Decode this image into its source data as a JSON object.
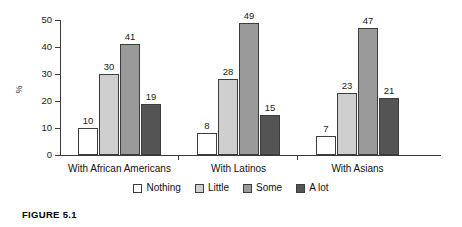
{
  "figure": {
    "caption": "FIGURE 5.1"
  },
  "chart_data": {
    "type": "bar",
    "title": "",
    "subtitle": "",
    "xlabel": "",
    "ylabel": "%",
    "ylim": [
      0,
      50
    ],
    "yticks": [
      0,
      10,
      20,
      30,
      40,
      50
    ],
    "ytick_labels": [
      "0",
      "10",
      "20",
      "30",
      "40",
      "50"
    ],
    "grid": false,
    "legend_position": "bottom",
    "categories": [
      "With African Americans",
      "With Latinos",
      "With Asians"
    ],
    "series": [
      {
        "name": "Nothing",
        "color": "#ffffff",
        "values": [
          10,
          8,
          7
        ]
      },
      {
        "name": "Little",
        "color": "#cfcfcf",
        "values": [
          30,
          28,
          23
        ]
      },
      {
        "name": "Some",
        "color": "#9a9a9a",
        "values": [
          41,
          49,
          47
        ]
      },
      {
        "name": "A lot",
        "color": "#545454",
        "values": [
          19,
          15,
          21
        ]
      }
    ],
    "data_labels": {
      "With African Americans": [
        "10",
        "30",
        "41",
        "19"
      ],
      "With Latinos": [
        "8",
        "28",
        "49",
        "15"
      ],
      "With Asians": [
        "7",
        "23",
        "47",
        "21"
      ]
    }
  },
  "legend": {
    "items": [
      {
        "label": "Nothing",
        "color": "#ffffff"
      },
      {
        "label": "Little",
        "color": "#cfcfcf"
      },
      {
        "label": "Some",
        "color": "#9a9a9a"
      },
      {
        "label": "A lot",
        "color": "#545454"
      }
    ]
  },
  "axis": {
    "y_title": "%",
    "y_labels": [
      "50",
      "40",
      "30",
      "20",
      "10",
      "0"
    ]
  }
}
